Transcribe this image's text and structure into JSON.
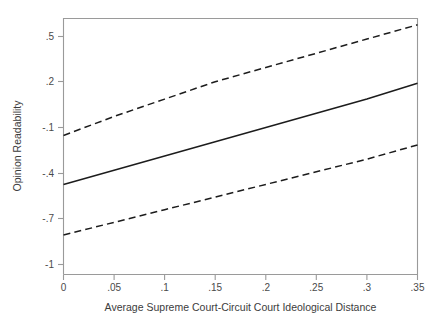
{
  "chart_data": {
    "type": "line",
    "title": "",
    "subtitle": "",
    "xlabel": "Average Supreme Court-Circuit Court Ideological Distance",
    "ylabel": "Opinion Readability",
    "xlim": [
      0,
      0.35
    ],
    "ylim": [
      -1,
      0.62
    ],
    "grid": false,
    "legend": "none",
    "x_tick_labels": [
      "0",
      ".05",
      ".1",
      ".15",
      ".2",
      ".25",
      ".3",
      ".35"
    ],
    "x_tick_values": [
      0,
      0.05,
      0.1,
      0.15,
      0.2,
      0.25,
      0.3,
      0.35
    ],
    "y_tick_labels": [
      ".5",
      ".2",
      "-.1",
      "-.4",
      "-.7",
      "-1"
    ],
    "y_tick_values": [
      0.5,
      0.2,
      -0.1,
      -0.4,
      -0.7,
      -1
    ],
    "x": [
      0,
      0.05,
      0.1,
      0.15,
      0.2,
      0.25,
      0.3,
      0.35
    ],
    "series": [
      {
        "name": "Upper 95% confidence bound",
        "style": "dashed",
        "values": [
          -0.12,
          0.0,
          0.11,
          0.22,
          0.31,
          0.4,
          0.49,
          0.58
        ]
      },
      {
        "name": "Predicted opinion readability",
        "style": "solid",
        "values": [
          -0.43,
          -0.34,
          -0.25,
          -0.16,
          -0.07,
          0.02,
          0.11,
          0.21
        ]
      },
      {
        "name": "Lower 95% confidence bound",
        "style": "dashed",
        "values": [
          -0.75,
          -0.67,
          -0.59,
          -0.51,
          -0.43,
          -0.35,
          -0.27,
          -0.18
        ]
      }
    ]
  },
  "colors": {
    "line": "#1c1c1c",
    "axis": "#9a9a9a",
    "text": "#3c3c3c",
    "background": "#ffffff"
  },
  "axes": {
    "x_title": "Average Supreme Court-Circuit Court Ideological Distance",
    "y_title": "Opinion Readability"
  }
}
